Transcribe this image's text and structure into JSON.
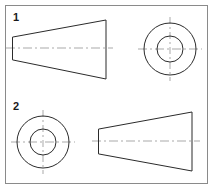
{
  "sheet": {
    "title": "Orthographic projection exercise sheet",
    "background_color": "#ffffff",
    "frame_color": "#8a8a8a",
    "line_color": "#2b2b2b",
    "centerline_color": "#a9a9a9",
    "width": 215,
    "height": 190
  },
  "panels": [
    {
      "number": "1",
      "number_x": 13,
      "number_y": 21,
      "side_view": {
        "name": "truncated-cone-side-view",
        "description": "Frustum shown as trapezoid, small face at left, large face at right",
        "points": "13,37 106,20 106,79 13,60",
        "centerline": {
          "x1": 6,
          "y1": 48,
          "x2": 113,
          "y2": 48
        }
      },
      "end_view": {
        "name": "concentric-circles-end-view",
        "description": "End view showing outer and inner circle of the frustum",
        "center_x": 170,
        "center_y": 49,
        "outer_radius": 26,
        "inner_radius": 13,
        "centerline_horizontal": {
          "x1": 138,
          "y1": 49,
          "x2": 202,
          "y2": 49
        },
        "centerline_vertical": {
          "x1": 170,
          "y1": 17,
          "x2": 170,
          "y2": 81
        }
      }
    },
    {
      "number": "2",
      "number_x": 13,
      "number_y": 110,
      "end_view": {
        "name": "concentric-circles-end-view",
        "description": "End view showing outer and inner circle of the frustum",
        "center_x": 43,
        "center_y": 142,
        "outer_radius": 26,
        "inner_radius": 13,
        "centerline_horizontal": {
          "x1": 11,
          "y1": 142,
          "x2": 75,
          "y2": 142
        },
        "centerline_vertical": {
          "x1": 43,
          "y1": 110,
          "x2": 43,
          "y2": 174
        }
      },
      "side_view": {
        "name": "truncated-cone-side-view",
        "description": "Frustum shown as trapezoid, small face at left, large face at right",
        "points": "99,129 192,112 192,171 99,154",
        "centerline": {
          "x1": 92,
          "y1": 141,
          "x2": 200,
          "y2": 141
        }
      }
    }
  ]
}
